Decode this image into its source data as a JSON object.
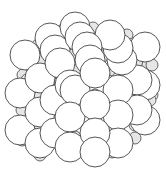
{
  "diagram": {
    "type": "crystal-lattice",
    "colors": {
      "large_fill": "#ffffff",
      "small_fill": "#e6e6e6",
      "stroke": "#444444",
      "background": "#ffffff"
    },
    "small_spheres": [
      [
        63,
        30
      ],
      [
        93,
        28
      ],
      [
        127,
        35
      ],
      [
        38,
        45
      ],
      [
        68,
        44
      ],
      [
        100,
        42
      ],
      [
        133,
        44
      ],
      [
        40,
        60
      ],
      [
        72,
        55
      ],
      [
        103,
        56
      ],
      [
        137,
        62
      ],
      [
        148,
        65
      ],
      [
        23,
        75
      ],
      [
        55,
        72
      ],
      [
        80,
        70
      ],
      [
        110,
        70
      ],
      [
        130,
        70
      ],
      [
        152,
        65
      ],
      [
        27,
        80
      ],
      [
        60,
        82
      ],
      [
        78,
        70
      ],
      [
        107,
        80
      ],
      [
        128,
        82
      ],
      [
        152,
        95
      ],
      [
        22,
        110
      ],
      [
        40,
        96
      ],
      [
        58,
        103
      ],
      [
        75,
        95
      ],
      [
        95,
        95
      ],
      [
        112,
        95
      ],
      [
        130,
        100
      ],
      [
        150,
        100
      ],
      [
        40,
        125
      ],
      [
        75,
        110
      ],
      [
        95,
        113
      ],
      [
        112,
        112
      ],
      [
        135,
        125
      ],
      [
        150,
        125
      ],
      [
        22,
        140
      ],
      [
        58,
        130
      ],
      [
        75,
        137
      ],
      [
        95,
        135
      ],
      [
        112,
        130
      ],
      [
        135,
        138
      ],
      [
        40,
        155
      ],
      [
        75,
        150
      ],
      [
        112,
        152
      ]
    ],
    "large_spheres": [
      {
        "cx": 75,
        "cy": 27,
        "r": 15
      },
      {
        "cx": 50,
        "cy": 38,
        "r": 15
      },
      {
        "cx": 80,
        "cy": 37,
        "r": 15
      },
      {
        "cx": 110,
        "cy": 35,
        "r": 15
      },
      {
        "cx": 25,
        "cy": 55,
        "r": 15
      },
      {
        "cx": 55,
        "cy": 50,
        "r": 15
      },
      {
        "cx": 87,
        "cy": 47,
        "r": 15
      },
      {
        "cx": 118,
        "cy": 48,
        "r": 15
      },
      {
        "cx": 145,
        "cy": 47,
        "r": 15
      },
      {
        "cx": 20,
        "cy": 93,
        "r": 15
      },
      {
        "cx": 40,
        "cy": 78,
        "r": 15
      },
      {
        "cx": 60,
        "cy": 63,
        "r": 15
      },
      {
        "cx": 90,
        "cy": 60,
        "r": 15
      },
      {
        "cx": 122,
        "cy": 60,
        "r": 15
      },
      {
        "cx": 137,
        "cy": 80,
        "r": 15
      },
      {
        "cx": 145,
        "cy": 85,
        "r": 15
      },
      {
        "cx": 70,
        "cy": 85,
        "r": 15
      },
      {
        "cx": 55,
        "cy": 100,
        "r": 15
      },
      {
        "cx": 75,
        "cy": 90,
        "r": 15
      },
      {
        "cx": 118,
        "cy": 90,
        "r": 15
      },
      {
        "cx": 20,
        "cy": 130,
        "r": 15
      },
      {
        "cx": 40,
        "cy": 112,
        "r": 15
      },
      {
        "cx": 70,
        "cy": 117,
        "r": 15
      },
      {
        "cx": 118,
        "cy": 115,
        "r": 15
      },
      {
        "cx": 137,
        "cy": 110,
        "r": 15
      },
      {
        "cx": 145,
        "cy": 120,
        "r": 15
      },
      {
        "cx": 55,
        "cy": 133,
        "r": 15
      },
      {
        "cx": 40,
        "cy": 143,
        "r": 15
      },
      {
        "cx": 70,
        "cy": 147,
        "r": 15
      },
      {
        "cx": 118,
        "cy": 143,
        "r": 15
      },
      {
        "cx": 95,
        "cy": 73,
        "r": 15
      },
      {
        "cx": 95,
        "cy": 105,
        "r": 15
      },
      {
        "cx": 95,
        "cy": 133,
        "r": 15
      },
      {
        "cx": 95,
        "cy": 152,
        "r": 15
      }
    ]
  }
}
